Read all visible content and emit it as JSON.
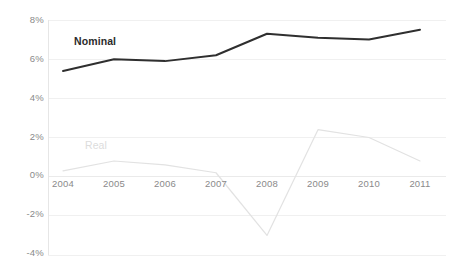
{
  "chart_data": {
    "type": "line",
    "title": "",
    "subtitle": "",
    "xlabel": "",
    "ylabel": "",
    "categories": [
      "2004",
      "2005",
      "2006",
      "2007",
      "2008",
      "2009",
      "2010",
      "2011"
    ],
    "x_tick_labels": [
      "2004",
      "2005",
      "2006",
      "2007",
      "2008",
      "2009",
      "2010",
      "2011"
    ],
    "y_tick_labels": [
      "8%",
      "6%",
      "4%",
      "2%",
      "0%",
      "-2%",
      "-4%"
    ],
    "y_tick_values": [
      8,
      6,
      4,
      2,
      0,
      -2,
      -4
    ],
    "ylim": [
      -4,
      8
    ],
    "xlim": [
      "2004",
      "2011"
    ],
    "grid": true,
    "grid_axis": "y",
    "legend": "inline-series-labels",
    "legend_position": "inline",
    "value_suffix": "%",
    "series": [
      {
        "name": "Nominal",
        "color": "#2f2f2f",
        "line_width": 2,
        "values": [
          5.4,
          6.0,
          5.9,
          6.2,
          7.3,
          7.1,
          7.0,
          7.5
        ],
        "label_text": "Nominal"
      },
      {
        "name": "Real",
        "color": "#e2e2e2",
        "line_width": 1.2,
        "values": [
          0.3,
          0.8,
          0.6,
          0.2,
          -3.0,
          2.4,
          2.0,
          0.8
        ],
        "label_text": "Real"
      }
    ],
    "annotations": [
      {
        "text": "Nominal",
        "series": "Nominal"
      },
      {
        "text": "Real",
        "series": "Real"
      }
    ],
    "colors": {
      "nominal_line": "#2f2f2f",
      "real_line": "#e2e2e2",
      "gridline": "#f0f0f0",
      "axis_line": "#e6e6e6",
      "zero_line": "#eaeaea",
      "tick_text": "#8a8a8a",
      "background": "#ffffff"
    }
  }
}
